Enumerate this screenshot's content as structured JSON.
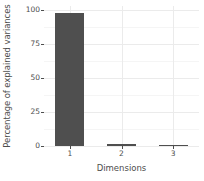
{
  "chart_data": {
    "type": "bar",
    "title": "",
    "xlabel": "Dimensions",
    "ylabel": "Percentage of explained variances",
    "categories": [
      "1",
      "2",
      "3"
    ],
    "values": [
      98.0,
      1.3,
      1.0
    ],
    "ylim": [
      0,
      103
    ],
    "yticks": [
      0,
      25,
      50,
      75,
      100
    ],
    "ytick_labels": [
      "0",
      "25",
      "50",
      "75",
      "100"
    ],
    "yminor_ticks": [
      12.5,
      37.5,
      62.5,
      87.5
    ],
    "grid": true,
    "legend": "none",
    "bar_color": "#4f4f4f",
    "panel_background": "#ffffff",
    "grid_major_color": "#ebebeb",
    "grid_minor_color": "#f5f5f5",
    "axis_text_color": "#4d4d4d"
  }
}
